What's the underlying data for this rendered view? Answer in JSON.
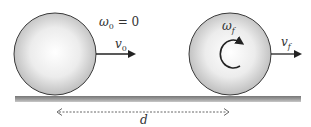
{
  "diagram": {
    "initial_state": {
      "omega_symbol": "ω",
      "omega_sub": "0",
      "omega_eq": " = 0",
      "velocity_symbol": "v",
      "velocity_sub": "0"
    },
    "final_state": {
      "omega_symbol": "ω",
      "omega_sub": "f",
      "velocity_symbol": "v",
      "velocity_sub": "f"
    },
    "distance_label": "d",
    "colors": {
      "ball_edge": "#3a3a3a",
      "ball_light": "#ffffff",
      "ball_dark": "#b8b8b8",
      "ground": "#8c8c8c",
      "arrow": "#222222",
      "dashed": "#555555"
    }
  }
}
